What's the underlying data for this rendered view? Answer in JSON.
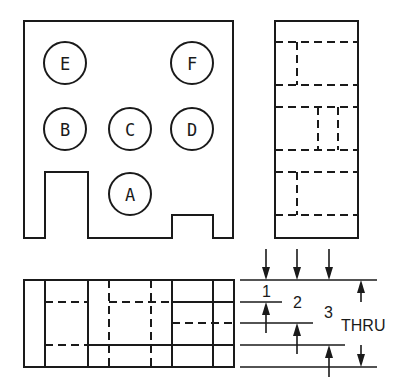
{
  "drawing": {
    "type": "orthographic-projection",
    "views": [
      "front",
      "right-side",
      "top"
    ],
    "line_color": "#1a1a1a",
    "background": "#ffffff"
  },
  "front_view": {
    "holes": [
      {
        "label": "E",
        "cx": 65,
        "cy": 63
      },
      {
        "label": "F",
        "cx": 192,
        "cy": 63
      },
      {
        "label": "B",
        "cx": 65,
        "cy": 129
      },
      {
        "label": "C",
        "cx": 130,
        "cy": 129
      },
      {
        "label": "D",
        "cx": 192,
        "cy": 129
      },
      {
        "label": "A",
        "cx": 130,
        "cy": 194
      }
    ],
    "hole_radius": 21
  },
  "dimensions": {
    "depth_1": "1",
    "depth_2": "2",
    "depth_3": "3",
    "thru_label": "THRU"
  }
}
